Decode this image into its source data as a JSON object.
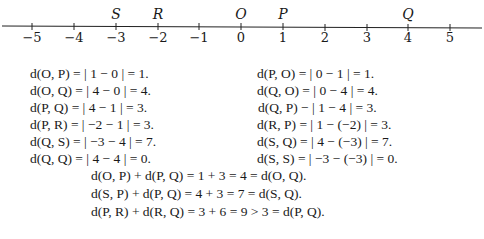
{
  "number_line": {
    "ticks": [
      {
        "label": "−5",
        "x": 32
      },
      {
        "label": "−4",
        "x": 74
      },
      {
        "label": "−3",
        "x": 116
      },
      {
        "label": "−2",
        "x": 158
      },
      {
        "label": "−1",
        "x": 199
      },
      {
        "label": "0",
        "x": 241
      },
      {
        "label": "1",
        "x": 283
      },
      {
        "label": "2",
        "x": 325
      },
      {
        "label": "3",
        "x": 367
      },
      {
        "label": "4",
        "x": 408
      },
      {
        "label": "5",
        "x": 450
      }
    ],
    "points": [
      {
        "label": "S",
        "x": 116
      },
      {
        "label": "R",
        "x": 158
      },
      {
        "label": "O",
        "x": 241
      },
      {
        "label": "P",
        "x": 283
      },
      {
        "label": "Q",
        "x": 408
      }
    ]
  },
  "left_column": [
    "d(O, P) = | 1 − 0 | = 1.",
    "d(O, Q) = | 4 − 0 | = 4.",
    "d(P, Q) = | 4 − 1 | = 3.",
    "d(P, R) = | −2 − 1 | = 3.",
    "d(Q, S) = | −3 − 4 | = 7.",
    "d(Q, Q) = | 4 − 4 | = 0."
  ],
  "right_column": [
    "d(P, O) = | 0 − 1 | = 1.",
    "d(Q, O) = | 0 − 4 | = 4.",
    "d(Q, P) − | 1 − 4 | = 3.",
    "d(R, P) = | 1 − (−2) | = 3.",
    "d(S, Q) = | 4 − (−3) | = 7.",
    "d(S, S) = | −3 − (−3) | = 0."
  ],
  "triangle_lines": [
    "d(O, P) + d(P, Q) = 1 + 3 = 4 = d(O, Q).",
    "d(S, P) + d(P, Q) = 4 + 3 = 7 = d(S, Q).",
    "d(P, R) + d(R, Q) = 3 + 6 = 9 > 3 = d(P, Q)."
  ]
}
